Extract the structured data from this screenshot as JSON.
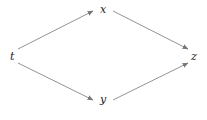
{
  "diagram": {
    "type": "commutative-diagram",
    "nodes": [
      {
        "id": "t",
        "label": "t",
        "x": 12,
        "y": 60
      },
      {
        "id": "x",
        "label": "x",
        "x": 103,
        "y": 13
      },
      {
        "id": "y",
        "label": "y",
        "x": 103,
        "y": 103
      },
      {
        "id": "z",
        "label": "z",
        "x": 194,
        "y": 60
      }
    ],
    "edges": [
      {
        "from": "t",
        "to": "x"
      },
      {
        "from": "t",
        "to": "y"
      },
      {
        "from": "x",
        "to": "z"
      },
      {
        "from": "y",
        "to": "z"
      }
    ],
    "colors": {
      "edge": "#777777",
      "label": "#222222",
      "background": "#ffffff"
    }
  }
}
